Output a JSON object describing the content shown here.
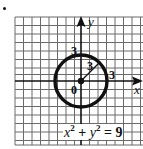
{
  "diagram": {
    "type": "circle-on-coordinate-grid",
    "bullet": true,
    "grid": {
      "color": "#555555",
      "cell_px": 8.5
    },
    "axes": {
      "x_label": "x",
      "y_label": "y",
      "origin_label": "0"
    },
    "circle": {
      "center": [
        0,
        0
      ],
      "radius": 3,
      "color": "#111111"
    },
    "labels": {
      "y_intercept": "3",
      "x_intercept": "3",
      "radius": "3"
    },
    "equation": {
      "x": "x",
      "x_exp": "2",
      "plus": "+",
      "y": "y",
      "y_exp": "2",
      "equals": "= 9"
    }
  }
}
